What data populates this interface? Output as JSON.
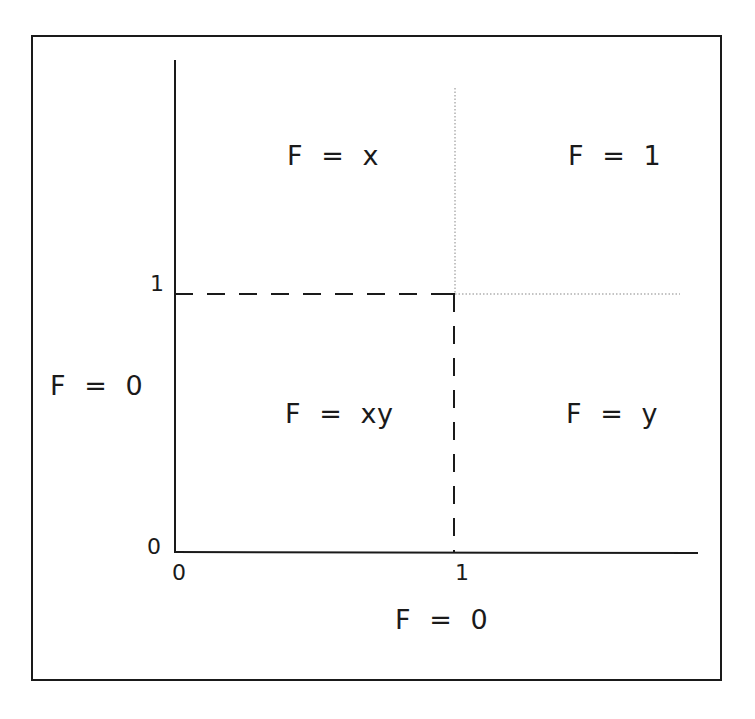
{
  "diagram": {
    "regions": {
      "top_left": "F  =  x",
      "top_right": "F  =  1",
      "bottom_left": "F  =  xy",
      "bottom_right": "F  =  y",
      "left_outside": "F  =  0",
      "below_outside": "F  =  0"
    },
    "axis_ticks": {
      "y_one": "1",
      "y_zero": "0",
      "x_zero": "0",
      "x_one": "1"
    },
    "colors": {
      "ink": "#1a1a1a",
      "dotted": "#888888",
      "background": "#ffffff"
    }
  }
}
